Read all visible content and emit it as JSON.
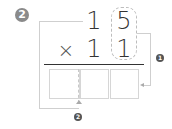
{
  "diagram": {
    "step_badge": "2",
    "multiplicand": {
      "tens": "1",
      "ones": "5"
    },
    "operator": "×",
    "multiplier": {
      "tens": "1",
      "ones": "1"
    },
    "answer_boxes": [
      "",
      "",
      ""
    ],
    "callouts": [
      {
        "label": "1",
        "description": "ones column multiplied into last answer box"
      },
      {
        "label": "2",
        "description": "tens column shifted to first answer boxes"
      }
    ],
    "colors": {
      "badge": "#8a8a8a",
      "lines": "#cfcfcf",
      "digits": "#333333",
      "rule": "#333333"
    }
  }
}
